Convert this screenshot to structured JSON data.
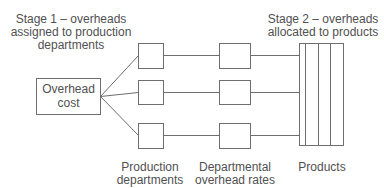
{
  "diagram": {
    "stage1_label": [
      "Stage 1 – overheads",
      "assigned to production",
      "departments"
    ],
    "stage2_label": [
      "Stage 2 – overheads",
      "allocated to products"
    ],
    "overhead_cost_label": [
      "Overhead",
      "cost"
    ],
    "production_departments_label": [
      "Production",
      "departments"
    ],
    "departmental_rates_label": [
      "Departmental",
      "overhead rates"
    ],
    "products_label": "Products",
    "production_department_count": 3,
    "department_rate_count": 3,
    "product_column_count": 4,
    "colors": {
      "stroke": "#6e6e6e",
      "text": "#505050",
      "background": "#ffffff"
    }
  }
}
